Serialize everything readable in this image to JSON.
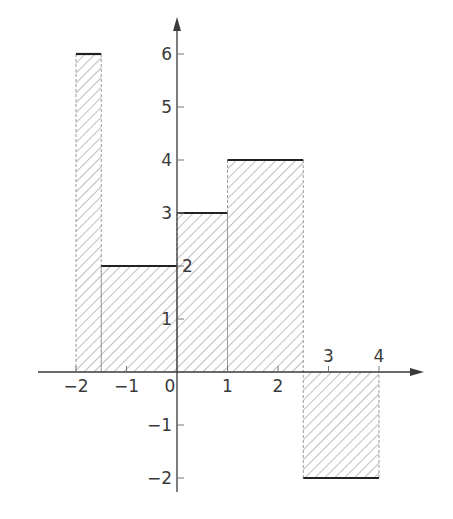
{
  "chart_data": {
    "type": "bar",
    "title": "",
    "xlabel": "",
    "ylabel": "",
    "bars": [
      {
        "x0": -2,
        "x1": -1.5,
        "value": 6
      },
      {
        "x0": -1.5,
        "x1": 0,
        "value": 2
      },
      {
        "x0": 0,
        "x1": 1,
        "value": 3
      },
      {
        "x0": 1,
        "x1": 2.5,
        "value": 4
      },
      {
        "x0": 2.5,
        "x1": 4,
        "value": -2
      }
    ],
    "xlim": [
      -2.8,
      4.8
    ],
    "ylim": [
      -2.3,
      6.8
    ],
    "x_ticks": [
      {
        "value": -2,
        "label": "−2",
        "label_side": "below"
      },
      {
        "value": -1,
        "label": "−1",
        "label_side": "below"
      },
      {
        "value": 0,
        "label": "0",
        "label_side": "below"
      },
      {
        "value": 1,
        "label": "1",
        "label_side": "below"
      },
      {
        "value": 2,
        "label": "2",
        "label_side": "below"
      },
      {
        "value": 3,
        "label": "3",
        "label_side": "above"
      },
      {
        "value": 4,
        "label": "4",
        "label_side": "above"
      }
    ],
    "y_ticks": [
      {
        "value": -2,
        "label": "−2"
      },
      {
        "value": -1,
        "label": "−1"
      },
      {
        "value": 1,
        "label": "1"
      },
      {
        "value": 2,
        "label": "2"
      },
      {
        "value": 3,
        "label": "3"
      },
      {
        "value": 4,
        "label": "4"
      },
      {
        "value": 5,
        "label": "5"
      },
      {
        "value": 6,
        "label": "6"
      }
    ],
    "fill": "diagonal-hatch",
    "grid": false,
    "legend": null
  },
  "style": {
    "axis_color": "#3a3a3a",
    "hatch_color": "#8a8a8a",
    "bar_top_color": "#222222",
    "bar_side_color": "#9a9a9a",
    "background": "#ffffff"
  }
}
